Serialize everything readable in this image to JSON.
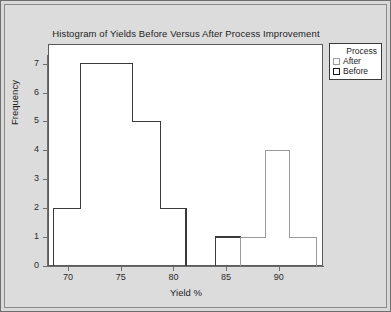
{
  "chart_data": {
    "type": "bar",
    "title": "Histogram of Yields Before Versus After Process Improvement",
    "xlabel": "Yield %",
    "ylabel": "Frequency",
    "xlim": [
      68.0,
      94.2
    ],
    "ylim": [
      0,
      7.3
    ],
    "grid": false,
    "legend": {
      "position": "top-right-outside",
      "title": "Process",
      "entries": [
        {
          "name": "After",
          "color": "#9a9a9a",
          "fill": "#ffffff"
        },
        {
          "name": "Before",
          "color": "#151515",
          "fill": "#ffffff"
        }
      ]
    },
    "xticks": [
      70,
      75,
      80,
      85,
      90
    ],
    "yticks": [
      0,
      1,
      2,
      3,
      4,
      5,
      6,
      7
    ],
    "series": [
      {
        "name": "Before",
        "color": "#3a3a3a",
        "bins": [
          {
            "start": 68.6,
            "end": 71.2,
            "value": 2
          },
          {
            "start": 71.2,
            "end": 76.1,
            "value": 7
          },
          {
            "start": 76.1,
            "end": 78.8,
            "value": 5
          },
          {
            "start": 78.8,
            "end": 81.2,
            "value": 2
          },
          {
            "start": 84.0,
            "end": 86.4,
            "value": 1
          }
        ]
      },
      {
        "name": "After",
        "color": "#9a9a9a",
        "bins": [
          {
            "start": 86.4,
            "end": 88.7,
            "value": 1
          },
          {
            "start": 88.7,
            "end": 91.0,
            "value": 4
          },
          {
            "start": 91.0,
            "end": 93.6,
            "value": 1
          }
        ]
      }
    ]
  },
  "legend": {
    "title": "Process",
    "items": [
      {
        "label": "After"
      },
      {
        "label": "Before"
      }
    ]
  },
  "axes": {
    "y_title": "Frequency",
    "x_title": "Yield %",
    "y_tick_labels": [
      "0",
      "1",
      "2",
      "3",
      "4",
      "5",
      "6",
      "7"
    ],
    "x_tick_labels": [
      "70",
      "75",
      "80",
      "85",
      "90"
    ]
  },
  "colors": {
    "page_background": "#dcdcdc",
    "plot_background": "#ffffff",
    "axis": "#6d6d6d",
    "before_series": "#3a3a3a",
    "after_series": "#9a9a9a",
    "text": "#1c1c1c"
  }
}
